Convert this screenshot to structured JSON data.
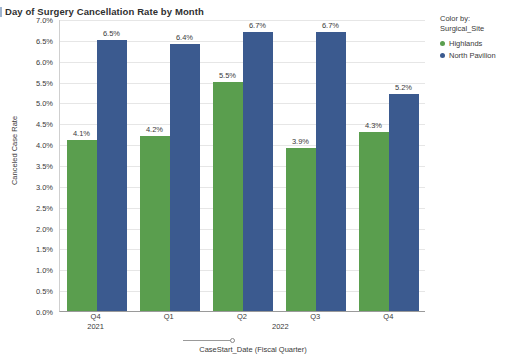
{
  "header": {
    "title": "Day of Surgery Cancellation Rate by Month",
    "accent_color": "#9fb4cf"
  },
  "legend": {
    "caption_line1": "Color by:",
    "caption_line2": "Surgical_Site",
    "items": [
      {
        "label": "Highlands",
        "color": "#5a9e4e"
      },
      {
        "label": "North Pavilion",
        "color": "#3b5a8f"
      }
    ]
  },
  "axes": {
    "y_title": "Canceled Case Rate",
    "x_title": "CaseStart_Date (Fiscal Quarter)",
    "y_ticks": [
      "7.0%",
      "6.5%",
      "6.0%",
      "5.5%",
      "5.0%",
      "4.5%",
      "4.0%",
      "3.5%",
      "3.0%",
      "2.5%",
      "2.0%",
      "1.5%",
      "1.0%",
      "0.5%",
      "0.0%"
    ],
    "periods": [
      {
        "id": "2021",
        "label": "2021"
      },
      {
        "id": "2022",
        "label": "2022"
      }
    ]
  },
  "chart_data": {
    "type": "bar",
    "title": "Day of Surgery Cancellation Rate by Month",
    "xlabel": "CaseStart_Date (Fiscal Quarter)",
    "ylabel": "Canceled Case Rate",
    "ylim": [
      0,
      7
    ],
    "ytick_step": 0.5,
    "grid": true,
    "legend_position": "right",
    "categories": [
      "Q4",
      "Q1",
      "Q2",
      "Q3",
      "Q4"
    ],
    "category_periods": [
      "2021",
      "2022",
      "2022",
      "2022",
      "2022"
    ],
    "series": [
      {
        "name": "Highlands",
        "color": "#5a9e4e",
        "values": [
          4.1,
          4.2,
          5.5,
          3.9,
          4.3
        ],
        "labels": [
          "4.1%",
          "4.2%",
          "5.5%",
          "3.9%",
          "4.3%"
        ]
      },
      {
        "name": "North Pavilion",
        "color": "#3b5a8f",
        "values": [
          6.5,
          6.4,
          6.7,
          6.7,
          5.2
        ],
        "labels": [
          "6.5%",
          "6.4%",
          "6.7%",
          "6.7%",
          "5.2%"
        ]
      }
    ]
  }
}
